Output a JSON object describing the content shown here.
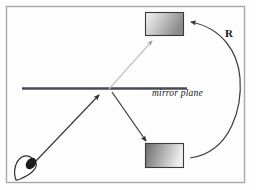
{
  "figure": {
    "background_color": "#fdfdfd",
    "frame": {
      "stroke": "#a8a8a8",
      "x": 6,
      "y": 6,
      "width": 238,
      "height": 176
    },
    "labels": {
      "mirror_plane": "mirror plane",
      "reflection_arc": "R"
    },
    "mirror_line": {
      "name": "mirror-plane-line",
      "color": "#4a4a55",
      "x1": 22,
      "y1": 88,
      "x2": 187,
      "y2": 88,
      "thickness": 2.4
    },
    "objects": [
      {
        "name": "mirrored-object-rectangle",
        "role": "virtual image above mirror plane",
        "x": 145,
        "y": 12,
        "width": 39,
        "height": 24,
        "fill_start": "#f2f2f2",
        "fill_end": "#8e8e8e",
        "stroke": "#3a3a3a"
      },
      {
        "name": "source-object-rectangle",
        "role": "real object below mirror plane",
        "x": 145,
        "y": 143,
        "width": 39,
        "height": 25,
        "fill_start": "#6e6e6e",
        "fill_end": "#efefef",
        "stroke": "#3a3a3a"
      }
    ],
    "eye": {
      "name": "viewer-eye-icon",
      "role": "observer / camera viewpoint",
      "cx": 28,
      "cy": 168,
      "stroke": "#2b2b2b",
      "pupil_fill": "#1c1c1c"
    },
    "rays": [
      {
        "name": "incident-ray",
        "role": "eye to mirror plane",
        "color": "#3c3c46",
        "x1": 34,
        "y1": 163,
        "x2": 100,
        "y2": 95,
        "arrow": "end"
      },
      {
        "name": "reflected-ray",
        "role": "mirror plane to real object",
        "color": "#3c3c46",
        "x1": 112,
        "y1": 92,
        "x2": 147,
        "y2": 142,
        "arrow": "end"
      },
      {
        "name": "virtual-ray",
        "role": "mirror plane to virtual image",
        "color": "#bdbdbd",
        "x1": 110,
        "y1": 89,
        "x2": 152,
        "y2": 40,
        "arrow": "end"
      }
    ],
    "arc": {
      "name": "reflection-transform-arc",
      "role": "R transform from real object to virtual image",
      "color": "#3c3c46",
      "start_x": 190,
      "start_y": 158,
      "end_x": 190,
      "end_y": 22,
      "bulge_x": 240
    }
  }
}
